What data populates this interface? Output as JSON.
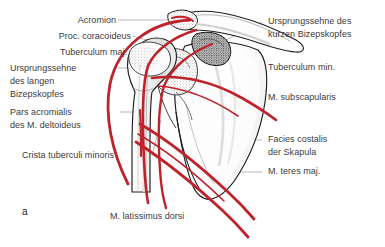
{
  "figure": {
    "letter": "a",
    "colors": {
      "muscle_red": "#c0222b",
      "text": "#3b3b3b",
      "leader_line": "#9a9a9a",
      "bone_outline": "#1d1d1d",
      "bone_fill": "#fbfbfa",
      "background": "#ffffff"
    }
  },
  "labels_left": [
    {
      "id": "acromion",
      "text": "Acromion"
    },
    {
      "id": "proc-coracoideus",
      "text": "Proc. coracoideus"
    },
    {
      "id": "tuberculum-maj",
      "text": "Tuberculum maj."
    },
    {
      "id": "ursprungssehne-langen-bizepskopfes-1",
      "text": "Ursprungssehne"
    },
    {
      "id": "ursprungssehne-langen-bizepskopfes-2",
      "text": "des langen"
    },
    {
      "id": "ursprungssehne-langen-bizepskopfes-3",
      "text": "Bizepskopfes"
    },
    {
      "id": "pars-acromialis-1",
      "text": "Pars acromialis"
    },
    {
      "id": "pars-acromialis-2",
      "text": "des M. deltoideus"
    },
    {
      "id": "crista-tuberculi-minoris",
      "text": "Crista tuberculi minoris"
    },
    {
      "id": "m-latissimus-dorsi",
      "text": "M. latissimus dorsi"
    }
  ],
  "labels_right": [
    {
      "id": "ursprungssehne-kurzen-bizepskopfes-1",
      "text": "Ursprungssehne des"
    },
    {
      "id": "ursprungssehne-kurzen-bizepskopfes-2",
      "text": "kurzen Bizepskopfes"
    },
    {
      "id": "tuberculum-min",
      "text": "Tuberculum min."
    },
    {
      "id": "m-subscapularis",
      "text": "M. subscapularis"
    },
    {
      "id": "facies-costalis-1",
      "text": "Facies costalis"
    },
    {
      "id": "facies-costalis-2",
      "text": "der Skapula"
    },
    {
      "id": "m-teres-maj",
      "text": "M. teres maj."
    }
  ]
}
